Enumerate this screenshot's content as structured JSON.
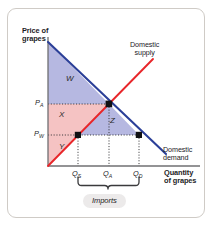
{
  "figure": {
    "type": "supply-demand-diagram",
    "axes": {
      "y_title_line1": "Price of",
      "y_title_line2": "grapes",
      "x_title_line1": "Quantity",
      "x_title_line2": "of grapes"
    },
    "curves": [
      {
        "name": "domestic-supply",
        "label_line1": "Domestic",
        "label_line2": "supply",
        "color": "#e8262a"
      },
      {
        "name": "domestic-demand",
        "label_line1": "Domestic",
        "label_line2": "demand",
        "color": "#2b3f98"
      }
    ],
    "price_ticks": [
      {
        "name": "price-autarky",
        "symbol": "P",
        "sub": "A"
      },
      {
        "name": "price-world",
        "symbol": "P",
        "sub": "W"
      }
    ],
    "quantity_ticks": [
      {
        "name": "quantity-supplied",
        "symbol": "Q",
        "sub": "S"
      },
      {
        "name": "quantity-autarky",
        "symbol": "Q",
        "sub": "A"
      },
      {
        "name": "quantity-demanded",
        "symbol": "Q",
        "sub": "D"
      }
    ],
    "regions": [
      {
        "name": "region-w",
        "label": "W",
        "fill": "#b0b2de"
      },
      {
        "name": "region-x",
        "label": "X",
        "fill": "#f4bcbc"
      },
      {
        "name": "region-y",
        "label": "Y",
        "fill": "#f4bcbc"
      },
      {
        "name": "region-z",
        "label": "Z",
        "fill": "#b0b2de"
      }
    ],
    "annotation": {
      "name": "imports-bracket",
      "label": "Imports"
    },
    "colors": {
      "supply_line": "#e8262a",
      "demand_line": "#2b3f98",
      "shade_blue": "#b0b2de",
      "shade_pink": "#f4bcbc",
      "axis": "#6f6f72",
      "card_border": "#cfcbc6",
      "badge_bg": "#eceaea"
    }
  }
}
